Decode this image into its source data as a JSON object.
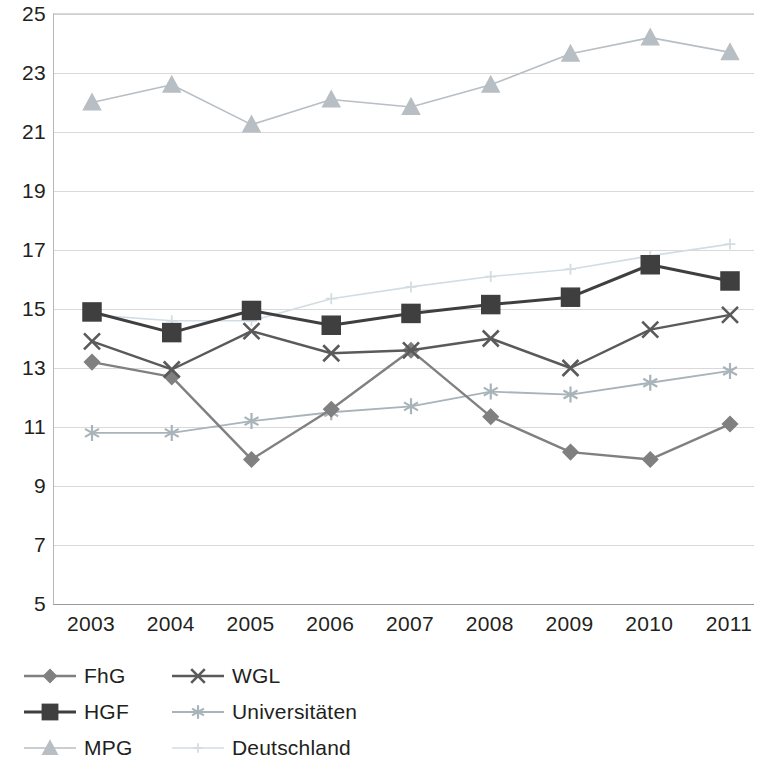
{
  "chart_data": {
    "type": "line",
    "title": "",
    "subtitle": "",
    "xlabel": "",
    "ylabel": "",
    "categories": [
      "2003",
      "2004",
      "2005",
      "2006",
      "2007",
      "2008",
      "2009",
      "2010",
      "2011"
    ],
    "x": [
      2003,
      2004,
      2005,
      2006,
      2007,
      2008,
      2009,
      2010,
      2011
    ],
    "xlim": [
      2003,
      2011
    ],
    "ylim": [
      5,
      25
    ],
    "y_ticks": [
      5,
      7,
      9,
      11,
      13,
      15,
      17,
      19,
      21,
      23,
      25
    ],
    "x_ticks": [
      "2003",
      "2004",
      "2005",
      "2006",
      "2007",
      "2008",
      "2009",
      "2010",
      "2011"
    ],
    "grid": true,
    "legend_position": "bottom-left",
    "series": [
      {
        "name": "FhG",
        "marker": "diamond",
        "color": "#808080",
        "values": [
          13.2,
          12.7,
          9.9,
          11.6,
          13.6,
          11.35,
          10.15,
          9.9,
          11.1
        ]
      },
      {
        "name": "HGF",
        "marker": "square",
        "color": "#3f3f3f",
        "values": [
          14.9,
          14.2,
          14.95,
          14.45,
          14.85,
          15.15,
          15.4,
          16.5,
          15.95
        ]
      },
      {
        "name": "MPG",
        "marker": "triangle",
        "color": "#b7bec4",
        "values": [
          22.0,
          22.6,
          21.25,
          22.1,
          21.85,
          22.6,
          23.65,
          24.2,
          23.7
        ]
      },
      {
        "name": "WGL",
        "marker": "x",
        "color": "#5a5a5a",
        "values": [
          13.9,
          12.95,
          14.25,
          13.5,
          13.6,
          14.0,
          13.0,
          14.3,
          14.8
        ]
      },
      {
        "name": "Universitäten",
        "marker": "asterisk",
        "color": "#a8b4ba",
        "values": [
          10.8,
          10.8,
          11.2,
          11.5,
          11.7,
          12.2,
          12.1,
          12.5,
          12.9
        ]
      },
      {
        "name": "Deutschland",
        "marker": "plus",
        "color": "#d2dde3",
        "values": [
          14.8,
          14.6,
          14.6,
          15.35,
          15.75,
          16.1,
          16.35,
          16.8,
          17.2
        ]
      }
    ]
  },
  "legend": {
    "rows": [
      [
        {
          "label": "FhG",
          "marker": "diamond",
          "color": "#808080"
        },
        {
          "label": "WGL",
          "marker": "x",
          "color": "#5a5a5a"
        }
      ],
      [
        {
          "label": "HGF",
          "marker": "square",
          "color": "#3f3f3f"
        },
        {
          "label": "Universitäten",
          "marker": "asterisk",
          "color": "#a8b4ba"
        }
      ],
      [
        {
          "label": "MPG",
          "marker": "triangle",
          "color": "#b7bec4"
        },
        {
          "label": "Deutschland",
          "marker": "plus",
          "color": "#d2dde3"
        }
      ]
    ]
  },
  "axes": {
    "y_labels": [
      "25",
      "23",
      "21",
      "19",
      "17",
      "15",
      "13",
      "11",
      "9",
      "7",
      "5"
    ],
    "x_labels": [
      "2003",
      "2004",
      "2005",
      "2006",
      "2007",
      "2008",
      "2009",
      "2010",
      "2011"
    ]
  },
  "colors": {
    "gridline": "#d9d9d9",
    "axis": "#9a9a9a",
    "text": "#231f20"
  }
}
